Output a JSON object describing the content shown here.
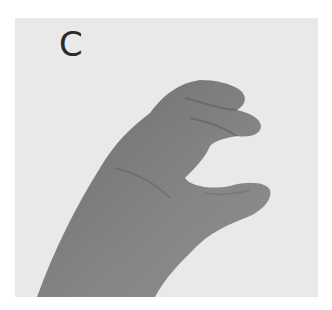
{
  "image": {
    "caption_letter": "C",
    "subject": "hand forming sign language letter C",
    "colors": {
      "background": "#e9e9e9",
      "hand": "#7a7a7a",
      "letter": "#2a2a2a"
    }
  }
}
